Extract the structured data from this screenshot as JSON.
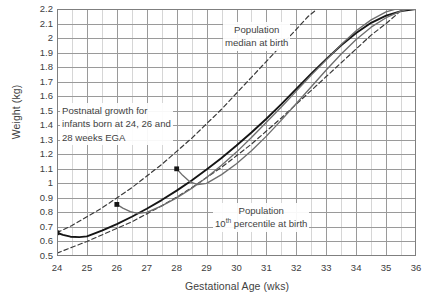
{
  "chart_data": {
    "type": "line",
    "title": "",
    "xlabel": "Gestational Age (wks)",
    "ylabel": "Weight (kg)",
    "xlim": [
      24,
      36
    ],
    "ylim": [
      0.5,
      2.2
    ],
    "xticks": [
      "24",
      "25",
      "26",
      "27",
      "28",
      "29",
      "30",
      "31",
      "32",
      "33",
      "34",
      "35",
      "36"
    ],
    "yticks": [
      "0.5",
      "0.6",
      "0.7",
      "0.8",
      "0.9",
      "1",
      "1.1",
      "1.2",
      "1.3",
      "1.4",
      "1.5",
      "1.6",
      "1.7",
      "1.8",
      "1.9",
      "2",
      "2.1",
      "2.2"
    ],
    "grid": true,
    "minor_grid": true,
    "legend_position": "none",
    "annotations": [
      {
        "id": "postnatal",
        "text": "Postnatal growth for infants born at 24, 26 and 28 weeks EGA",
        "lines": [
          "Postnatal growth for",
          "infants born at 24, 26 and",
          "28 weeks EGA"
        ]
      },
      {
        "id": "median",
        "text": "Population median at birth",
        "lines": [
          "Population",
          "median at birth"
        ]
      },
      {
        "id": "p10",
        "text": "Population 10th percentile at birth",
        "lines": [
          "Population",
          "10|th| percentile at birth"
        ]
      }
    ],
    "series": [
      {
        "name": "Population median at birth",
        "style": "dashed",
        "color": "#3a3a3a",
        "points": [
          [
            24,
            0.66
          ],
          [
            24.5,
            0.71
          ],
          [
            25,
            0.77
          ],
          [
            25.5,
            0.83
          ],
          [
            26,
            0.9
          ],
          [
            26.5,
            0.97
          ],
          [
            27,
            1.05
          ],
          [
            27.5,
            1.13
          ],
          [
            28,
            1.22
          ],
          [
            28.5,
            1.31
          ],
          [
            29,
            1.41
          ],
          [
            29.5,
            1.51
          ],
          [
            30,
            1.62
          ],
          [
            30.5,
            1.73
          ],
          [
            31,
            1.84
          ],
          [
            31.5,
            1.95
          ],
          [
            32,
            2.06
          ],
          [
            32.4,
            2.15
          ],
          [
            32.7,
            2.2
          ]
        ]
      },
      {
        "name": "Population 10th percentile at birth",
        "style": "dashed",
        "color": "#3a3a3a",
        "points": [
          [
            24,
            0.52
          ],
          [
            24.5,
            0.56
          ],
          [
            25,
            0.6
          ],
          [
            25.5,
            0.645
          ],
          [
            26,
            0.69
          ],
          [
            26.5,
            0.735
          ],
          [
            27,
            0.79
          ],
          [
            27.5,
            0.845
          ],
          [
            28,
            0.905
          ],
          [
            28.5,
            0.97
          ],
          [
            29,
            1.04
          ],
          [
            29.5,
            1.11
          ],
          [
            30,
            1.19
          ],
          [
            30.5,
            1.27
          ],
          [
            31,
            1.36
          ],
          [
            31.5,
            1.45
          ],
          [
            32,
            1.545
          ],
          [
            32.5,
            1.64
          ],
          [
            33,
            1.735
          ],
          [
            33.5,
            1.83
          ],
          [
            34,
            1.925
          ],
          [
            34.5,
            2.02
          ],
          [
            35,
            2.1
          ],
          [
            35.4,
            2.17
          ]
        ]
      },
      {
        "name": "Postnatal growth, born 24 weeks EGA",
        "style": "solid-bold",
        "color": "#151515",
        "birth_marker": [
          24,
          0.66
        ],
        "points": [
          [
            24,
            0.66
          ],
          [
            24.2,
            0.645
          ],
          [
            24.45,
            0.633
          ],
          [
            24.75,
            0.63
          ],
          [
            25,
            0.635
          ],
          [
            25.5,
            0.675
          ],
          [
            26,
            0.72
          ],
          [
            26.5,
            0.77
          ],
          [
            27,
            0.825
          ],
          [
            27.5,
            0.885
          ],
          [
            28,
            0.95
          ],
          [
            28.5,
            1.02
          ],
          [
            29,
            1.095
          ],
          [
            29.5,
            1.175
          ],
          [
            30,
            1.26
          ],
          [
            30.5,
            1.35
          ],
          [
            31,
            1.445
          ],
          [
            31.5,
            1.545
          ],
          [
            32,
            1.65
          ],
          [
            32.5,
            1.755
          ],
          [
            33,
            1.855
          ],
          [
            33.5,
            1.95
          ],
          [
            34,
            2.035
          ],
          [
            34.5,
            2.105
          ],
          [
            35,
            2.155
          ],
          [
            35.5,
            2.185
          ],
          [
            36,
            2.2
          ]
        ]
      },
      {
        "name": "Postnatal growth, born 26 weeks EGA",
        "style": "solid-gray",
        "color": "#6e6e6e",
        "birth_marker": [
          26,
          0.855
        ],
        "points": [
          [
            26,
            0.855
          ],
          [
            26.2,
            0.83
          ],
          [
            26.45,
            0.805
          ],
          [
            26.7,
            0.793
          ],
          [
            27,
            0.8
          ],
          [
            27.5,
            0.845
          ],
          [
            28,
            0.9
          ],
          [
            28.5,
            0.965
          ],
          [
            29,
            1.04
          ],
          [
            29.5,
            1.125
          ],
          [
            30,
            1.215
          ],
          [
            30.5,
            1.315
          ],
          [
            31,
            1.42
          ],
          [
            31.5,
            1.525
          ],
          [
            32,
            1.635
          ],
          [
            32.5,
            1.745
          ],
          [
            33,
            1.85
          ],
          [
            33.5,
            1.955
          ],
          [
            34,
            2.05
          ],
          [
            34.5,
            2.125
          ],
          [
            35,
            2.18
          ],
          [
            35.5,
            2.21
          ],
          [
            36,
            2.225
          ]
        ]
      },
      {
        "name": "Postnatal growth, born 28 weeks EGA",
        "style": "solid-gray",
        "color": "#6e6e6e",
        "birth_marker": [
          28,
          1.1
        ],
        "points": [
          [
            28,
            1.1
          ],
          [
            28.2,
            1.055
          ],
          [
            28.45,
            1.01
          ],
          [
            28.7,
            0.992
          ],
          [
            29,
            1.0
          ],
          [
            29.5,
            1.06
          ],
          [
            30,
            1.135
          ],
          [
            30.5,
            1.225
          ],
          [
            31,
            1.325
          ],
          [
            31.5,
            1.435
          ],
          [
            32,
            1.55
          ],
          [
            32.5,
            1.665
          ],
          [
            33,
            1.78
          ],
          [
            33.5,
            1.89
          ],
          [
            34,
            1.99
          ],
          [
            34.5,
            2.075
          ],
          [
            35,
            2.14
          ],
          [
            35.5,
            2.185
          ],
          [
            36,
            2.215
          ]
        ]
      }
    ]
  },
  "colors": {
    "grid_major": "#9a9a9a",
    "grid_minor": "#d6d6d6",
    "axis": "#7f7f7f",
    "text": "#404040",
    "curve_dark": "#151515",
    "curve_gray": "#6e6e6e",
    "dashed": "#3a3a3a"
  }
}
